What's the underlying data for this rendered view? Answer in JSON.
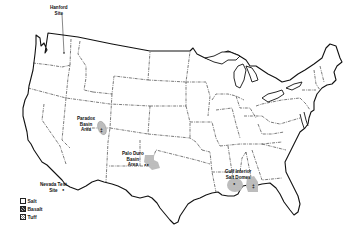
{
  "map": {
    "subject": "Contiguous United States",
    "style": "black-and-white line map with dash-dot state boundaries",
    "line_color": "#111111",
    "background": "#ffffff",
    "shading_color": "#b8b8b8"
  },
  "sites": [
    {
      "id": "hanford",
      "label_line1": "Hanford",
      "label_line2": "Site",
      "rock": "Basalt"
    },
    {
      "id": "paradox",
      "label_line1": "Paradox",
      "label_line2": "Basin",
      "label_line3": "Area",
      "rock": "Salt"
    },
    {
      "id": "nevada",
      "label_line1": "Nevada Test",
      "label_line2": "Site",
      "rock": "Tuff"
    },
    {
      "id": "palo-duro",
      "label_line1": "Palo Duro",
      "label_line2": "Basin",
      "label_line3": "Area",
      "rock": "Salt"
    },
    {
      "id": "gulf",
      "label_line1": "Gulf Interior",
      "label_line2": "Salt Domes",
      "rock": "Salt"
    }
  ],
  "legend": {
    "items": [
      {
        "label": "Salt",
        "pattern": "blank"
      },
      {
        "label": "Basalt",
        "pattern": "hatched"
      },
      {
        "label": "Tuff",
        "pattern": "crosshatch"
      }
    ]
  }
}
